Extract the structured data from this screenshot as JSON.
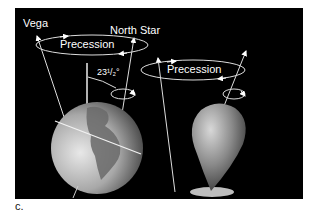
{
  "figure": {
    "caption": "c.",
    "background": "#000000",
    "left_diagram": {
      "subject": "Earth axial precession",
      "labels": {
        "vega": "Vega",
        "north_star": "North Star",
        "precession": "Precession",
        "tilt_angle": "23¹/₂°"
      }
    },
    "right_diagram": {
      "subject": "Spinning top precession",
      "labels": {
        "precession": "Precession"
      }
    }
  }
}
